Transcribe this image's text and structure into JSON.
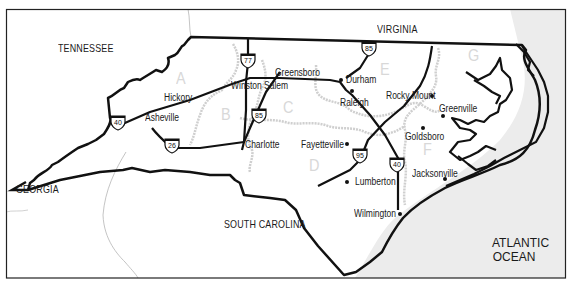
{
  "map": {
    "colors": {
      "background": "#ffffff",
      "ocean": "#ececec",
      "boundary": "#111111",
      "region_border": "#cfcfcf",
      "region_letter": "#d8d8d8",
      "state_border_thin": "#b5b5b5"
    },
    "states": [
      {
        "name": "TENNESSEE",
        "x": 58,
        "y": 43
      },
      {
        "name": "VIRGINIA",
        "x": 377,
        "y": 24
      },
      {
        "name": "GEORGIA",
        "x": 16,
        "y": 184
      },
      {
        "name": "SOUTH CAROLINA",
        "x": 224,
        "y": 219
      }
    ],
    "ocean_label": {
      "line1": "ATLANTIC",
      "line2": "OCEAN"
    },
    "cities": [
      {
        "name": "Hickory",
        "x": 164,
        "y": 93,
        "dot": null
      },
      {
        "name": "Asheville",
        "x": 145,
        "y": 113,
        "dot": null
      },
      {
        "name": "Winston Salem",
        "x": 231,
        "y": 81,
        "dot": null
      },
      {
        "name": "Greensboro",
        "x": 275,
        "y": 68,
        "dot": null
      },
      {
        "name": "Durham",
        "x": 346,
        "y": 75,
        "dot": [
          339,
          79
        ]
      },
      {
        "name": "Raleigh",
        "x": 340,
        "y": 98,
        "dot": [
          350,
          90
        ]
      },
      {
        "name": "Rocky Mount",
        "x": 386,
        "y": 91,
        "dot": [
          430,
          95
        ]
      },
      {
        "name": "Greenville",
        "x": 439,
        "y": 104,
        "dot": [
          441,
          115
        ]
      },
      {
        "name": "Goldsboro",
        "x": 405,
        "y": 132,
        "dot": [
          421,
          127
        ]
      },
      {
        "name": "Charlotte",
        "x": 245,
        "y": 140,
        "dot": null
      },
      {
        "name": "Fayetteville",
        "x": 301,
        "y": 140,
        "dot": [
          345,
          143
        ]
      },
      {
        "name": "Lumberton",
        "x": 355,
        "y": 177,
        "dot": [
          345,
          181
        ]
      },
      {
        "name": "Jacksonville",
        "x": 412,
        "y": 169,
        "dot": [
          443,
          178
        ]
      },
      {
        "name": "Wilmington",
        "x": 354,
        "y": 209,
        "dot": [
          398,
          213
        ]
      }
    ],
    "regions": [
      {
        "letter": "A",
        "x": 176,
        "y": 70
      },
      {
        "letter": "B",
        "x": 221,
        "y": 106
      },
      {
        "letter": "C",
        "x": 283,
        "y": 99
      },
      {
        "letter": "D",
        "x": 309,
        "y": 157
      },
      {
        "letter": "E",
        "x": 380,
        "y": 61
      },
      {
        "letter": "F",
        "x": 423,
        "y": 141
      },
      {
        "letter": "G",
        "x": 468,
        "y": 47
      }
    ],
    "interstates": [
      {
        "number": "77",
        "x": 240,
        "y": 52
      },
      {
        "number": "85",
        "x": 361,
        "y": 40
      },
      {
        "number": "85",
        "x": 251,
        "y": 107
      },
      {
        "number": "40",
        "x": 110,
        "y": 114
      },
      {
        "number": "26",
        "x": 164,
        "y": 137
      },
      {
        "number": "95",
        "x": 352,
        "y": 147
      },
      {
        "number": "40",
        "x": 389,
        "y": 156
      }
    ]
  }
}
